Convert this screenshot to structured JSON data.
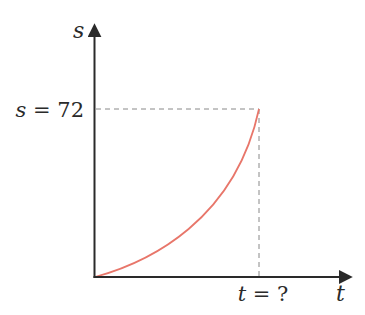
{
  "diagram": {
    "axes": {
      "y_label": "s",
      "x_label": "t"
    },
    "annotations": {
      "s_value_label": "s = 72",
      "t_value_label": "t = ?"
    },
    "colors": {
      "axis": "#2a2a2a",
      "curve": "#e8766a",
      "guide": "#888888"
    }
  },
  "chart_data": {
    "type": "line",
    "title": "",
    "xlabel": "t",
    "ylabel": "s",
    "series": [
      {
        "name": "s(t)",
        "description": "increasing, concave-up curve from origin to point (t = ?, s = 72)",
        "points": [
          [
            0,
            0
          ],
          [
            0.25,
            6
          ],
          [
            0.5,
            18
          ],
          [
            0.75,
            38
          ],
          [
            1.0,
            72
          ]
        ]
      }
    ],
    "annotations": [
      {
        "text": "s = 72",
        "type": "horizontal dashed guide",
        "value": 72
      },
      {
        "text": "t = ?",
        "type": "vertical dashed guide",
        "value": "unknown"
      }
    ],
    "grid": false,
    "legend": null
  }
}
